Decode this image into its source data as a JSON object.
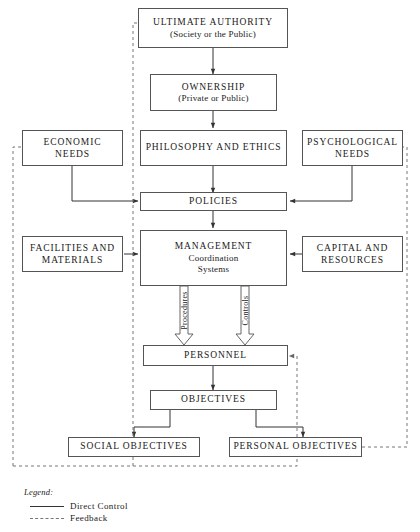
{
  "diagram": {
    "nodes": [
      {
        "id": "ultimate-authority",
        "line1": "ULTIMATE AUTHORITY",
        "line2": "(Society or the Public)"
      },
      {
        "id": "ownership",
        "line1": "OWNERSHIP",
        "line2": "(Private or Public)"
      },
      {
        "id": "economic-needs",
        "line1": "ECONOMIC",
        "line2": "NEEDS"
      },
      {
        "id": "philosophy-and-ethics",
        "line1": "PHILOSOPHY AND ETHICS"
      },
      {
        "id": "psychological-needs",
        "line1": "PSYCHOLOGICAL",
        "line2": "NEEDS"
      },
      {
        "id": "policies",
        "line1": "POLICIES"
      },
      {
        "id": "facilities-and-materials",
        "line1": "FACILITIES AND",
        "line2": "MATERIALS"
      },
      {
        "id": "management",
        "line1": "MANAGEMENT",
        "line2": "Coordination",
        "line3": "Systems"
      },
      {
        "id": "capital-and-resources",
        "line1": "CAPITAL AND",
        "line2": "RESOURCES"
      },
      {
        "id": "personnel",
        "line1": "PERSONNEL"
      },
      {
        "id": "objectives",
        "line1": "OBJECTIVES"
      },
      {
        "id": "social-objectives",
        "line1": "SOCIAL OBJECTIVES"
      },
      {
        "id": "personal-objectives",
        "line1": "PERSONAL OBJECTIVES"
      }
    ],
    "flow_labels": {
      "procedures": "Procedures",
      "controls": "Controls"
    },
    "legend": {
      "title": "Legend:",
      "entries": [
        {
          "style": "solid",
          "label": "Direct Control"
        },
        {
          "style": "dashed",
          "label": "Feedback"
        }
      ]
    },
    "colors": {
      "box_border": "#555555",
      "direct_control_line": "#333333",
      "feedback_line": "#777777",
      "background": "#ffffff",
      "text": "#1a1a1a"
    }
  }
}
